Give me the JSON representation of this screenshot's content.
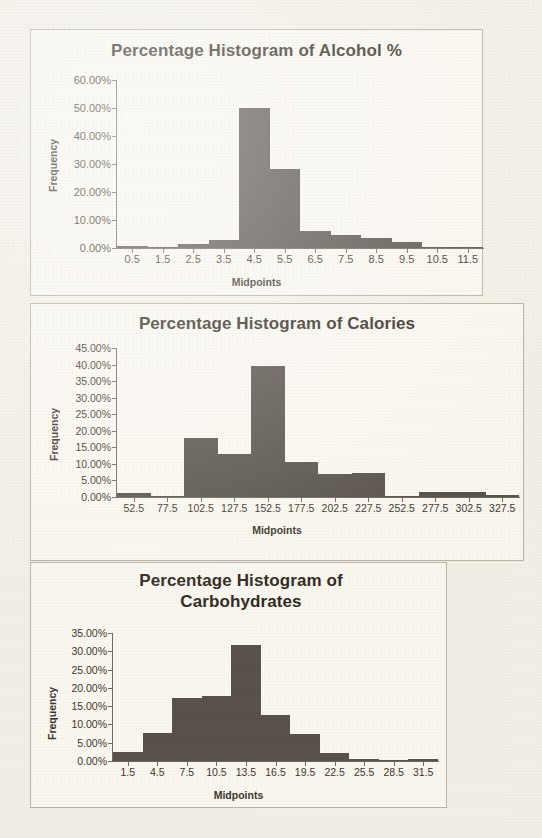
{
  "page": {
    "background_color": "#f2efe6",
    "panel_color": "#faf7f0",
    "bar_color": "#565049",
    "axis_color": "#6f675a",
    "text_color": "#3a342a"
  },
  "charts": [
    {
      "title": "Percentage Histogram of Alcohol %",
      "ylabel": "Frequency",
      "xlabel": "Midpoints",
      "yticks": [
        "0.00%",
        "10.00%",
        "20.00%",
        "30.00%",
        "40.00%",
        "50.00%",
        "60.00%"
      ],
      "xticks": [
        "0.5",
        "1.5",
        "2.5",
        "3.5",
        "4.5",
        "5.5",
        "6.5",
        "7.5",
        "8.5",
        "9.5",
        "10.5",
        "11.5"
      ]
    },
    {
      "title": "Percentage Histogram of Calories",
      "ylabel": "Frequency",
      "xlabel": "Midpoints",
      "yticks": [
        "0.00%",
        "5.00%",
        "10.00%",
        "15.00%",
        "20.00%",
        "25.00%",
        "30.00%",
        "35.00%",
        "40.00%",
        "45.00%"
      ],
      "xticks": [
        "52.5",
        "77.5",
        "102.5",
        "127.5",
        "152.5",
        "177.5",
        "202.5",
        "227.5",
        "252.5",
        "277.5",
        "302.5",
        "327.5"
      ]
    },
    {
      "title": "Percentage Histogram of Carbohydrates",
      "ylabel": "Frequency",
      "xlabel": "Midpoints",
      "yticks": [
        "0.00%",
        "5.00%",
        "10.00%",
        "15.00%",
        "20.00%",
        "25.00%",
        "30.00%",
        "35.00%"
      ],
      "xticks": [
        "1.5",
        "4.5",
        "7.5",
        "10.5",
        "13.5",
        "16.5",
        "19.5",
        "22.5",
        "25.5",
        "28.5",
        "31.5"
      ]
    }
  ],
  "chart_data": [
    {
      "type": "bar",
      "title": "Percentage Histogram of Alcohol %",
      "xlabel": "Midpoints",
      "ylabel": "Frequency",
      "categories": [
        "0.5",
        "1.5",
        "2.5",
        "3.5",
        "4.5",
        "5.5",
        "6.5",
        "7.5",
        "8.5",
        "9.5",
        "10.5",
        "11.5"
      ],
      "values": [
        0.8,
        0.0,
        1.3,
        2.8,
        50.0,
        28.3,
        6.0,
        4.7,
        3.5,
        2.0,
        0.0,
        0.5
      ],
      "value_unit": "percent",
      "ylim": [
        0,
        60
      ],
      "ytick_step": 10,
      "ytick_labels": [
        "0.00%",
        "10.00%",
        "20.00%",
        "30.00%",
        "40.00%",
        "50.00%",
        "60.00%"
      ],
      "grid": false,
      "legend": null,
      "bin_width": 1
    },
    {
      "type": "bar",
      "title": "Percentage Histogram of Calories",
      "xlabel": "Midpoints",
      "ylabel": "Frequency",
      "categories": [
        "52.5",
        "77.5",
        "102.5",
        "127.5",
        "152.5",
        "177.5",
        "202.5",
        "227.5",
        "252.5",
        "277.5",
        "302.5",
        "327.5"
      ],
      "values": [
        1.3,
        0.3,
        17.8,
        13.0,
        39.5,
        10.7,
        7.0,
        7.3,
        0.0,
        1.5,
        1.5,
        0.5
      ],
      "value_unit": "percent",
      "ylim": [
        0,
        45
      ],
      "ytick_step": 5,
      "ytick_labels": [
        "0.00%",
        "5.00%",
        "10.00%",
        "15.00%",
        "20.00%",
        "25.00%",
        "30.00%",
        "35.00%",
        "40.00%",
        "45.00%"
      ],
      "grid": false,
      "legend": null,
      "bin_width": 25
    },
    {
      "type": "bar",
      "title": "Percentage Histogram of Carbohydrates",
      "xlabel": "Midpoints",
      "ylabel": "Frequency",
      "categories": [
        "1.5",
        "4.5",
        "7.5",
        "10.5",
        "13.5",
        "16.5",
        "19.5",
        "22.5",
        "25.5",
        "28.5",
        "31.5"
      ],
      "values": [
        2.6,
        7.7,
        17.2,
        17.8,
        31.7,
        12.6,
        7.4,
        2.1,
        0.5,
        0.0,
        0.6
      ],
      "value_unit": "percent",
      "ylim": [
        0,
        35
      ],
      "ytick_step": 5,
      "ytick_labels": [
        "0.00%",
        "5.00%",
        "10.00%",
        "15.00%",
        "20.00%",
        "25.00%",
        "30.00%",
        "35.00%"
      ],
      "grid": false,
      "legend": null,
      "bin_width": 3
    }
  ]
}
